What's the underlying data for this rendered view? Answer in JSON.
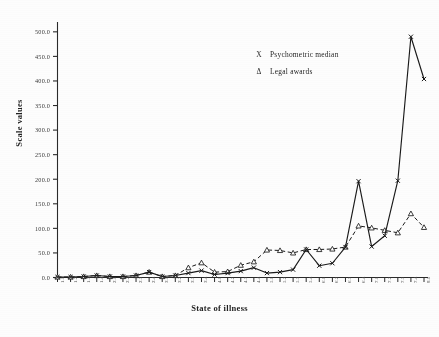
{
  "chart_data": {
    "type": "line",
    "title": "",
    "xlabel": "State of illness",
    "ylabel": "Scale values",
    "ylim": [
      0,
      500
    ],
    "yticks": [
      "0.0",
      "50.0",
      "100.0",
      "150.0",
      "200.0",
      "250.0",
      "300.0",
      "350.0",
      "400.0",
      "450.0",
      "500.0"
    ],
    "ytick_values": [
      0,
      50,
      100,
      150,
      200,
      250,
      300,
      350,
      400,
      450,
      500
    ],
    "grid": false,
    "legend_position": "upper-center-right",
    "categories": [
      "1.1",
      "1.2",
      "1.3",
      "1.4",
      "2.1",
      "2.2",
      "2.3",
      "2.4",
      "3.1",
      "3.2",
      "3.3",
      "3.4",
      "4.1",
      "4.2",
      "4.3",
      "4.4",
      "5.1",
      "5.2",
      "5.3",
      "5.4",
      "6.1",
      "6.2",
      "6.3",
      "6.4",
      "7.1",
      "7.2",
      "7.3",
      "7.4",
      "8.1"
    ],
    "series": [
      {
        "name": "Psychometric median",
        "marker": "X",
        "linestyle": "solid",
        "color": "#1a1a1a",
        "values": [
          1,
          1,
          2,
          4,
          2,
          2,
          4,
          11,
          2,
          4,
          9,
          14,
          6,
          9,
          13,
          20,
          9,
          11,
          16,
          57,
          24,
          29,
          62,
          196,
          63,
          85,
          197,
          490,
          404
        ]
      },
      {
        "name": "Legal awards",
        "marker": "triangle",
        "linestyle": "dashed",
        "color": "#1a1a1a",
        "values": [
          1,
          1,
          2,
          4,
          2,
          2,
          4,
          11,
          2,
          4,
          20,
          30,
          11,
          12,
          25,
          32,
          56,
          55,
          50,
          57,
          57,
          58,
          62,
          105,
          101,
          96,
          91,
          130,
          102
        ]
      }
    ]
  },
  "legend": {
    "items": [
      {
        "marker": "X",
        "label": "Psychometric median"
      },
      {
        "marker": "Δ",
        "label": "Legal awards"
      }
    ]
  },
  "caption": {
    "text": ""
  }
}
